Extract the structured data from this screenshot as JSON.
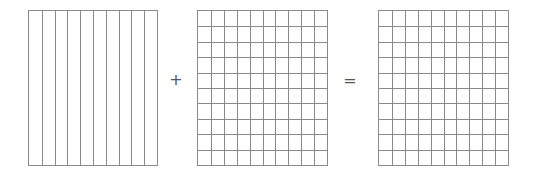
{
  "diagram": {
    "line_color": "#8a8a8a",
    "operators": {
      "plus": "+",
      "equals": "="
    },
    "grids": [
      {
        "id": "tenths",
        "columns": 10,
        "rows": 1,
        "x": 28,
        "y": 10,
        "width": 130,
        "height": 156
      },
      {
        "id": "hundredths-a",
        "columns": 10,
        "rows": 10,
        "x": 197,
        "y": 10,
        "width": 131,
        "height": 156
      },
      {
        "id": "hundredths-b",
        "columns": 10,
        "rows": 10,
        "x": 378,
        "y": 10,
        "width": 131,
        "height": 156
      }
    ]
  }
}
